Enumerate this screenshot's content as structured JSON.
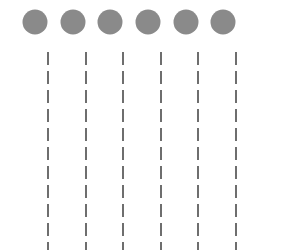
{
  "diagram": {
    "background": "#ffffff",
    "circle_color": "#8a8a8a",
    "line_color": "#6e6e6e",
    "circle_diameter": 25,
    "circle_center_y": 22,
    "line_width": 2,
    "line_start_y": 52,
    "line_end_y": 250,
    "dash_length": 13,
    "dash_gap": 6,
    "nodes": [
      {
        "id": 1,
        "circle_cx": 35,
        "line_x": 48
      },
      {
        "id": 2,
        "circle_cx": 73,
        "line_x": 86
      },
      {
        "id": 3,
        "circle_cx": 110,
        "line_x": 123
      },
      {
        "id": 4,
        "circle_cx": 148,
        "line_x": 161
      },
      {
        "id": 5,
        "circle_cx": 186,
        "line_x": 198
      },
      {
        "id": 6,
        "circle_cx": 223,
        "line_x": 236
      }
    ]
  }
}
